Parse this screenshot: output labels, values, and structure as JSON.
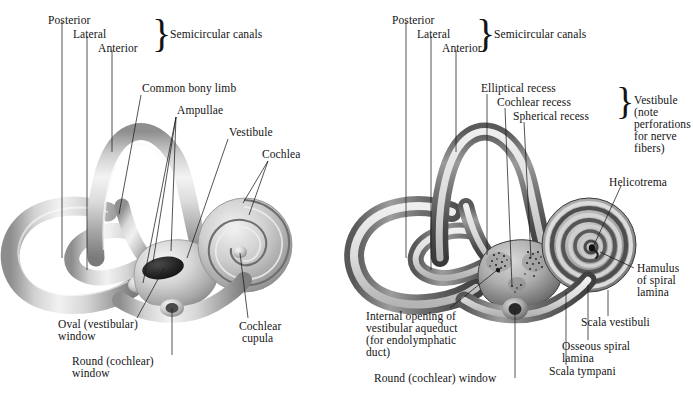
{
  "figure": {
    "background_color": "#ffffff",
    "ink_color": "#141414",
    "panels": [
      {
        "id": "left",
        "name": "bony-labyrinth-external-view",
        "caption": "External (surface) view of the right bony labyrinth"
      },
      {
        "id": "right",
        "name": "bony-labyrinth-sectioned-view",
        "caption": "Sectioned (cut-away) view of the right bony labyrinth"
      }
    ]
  },
  "left_panel": {
    "brace_glyph": "}",
    "labels": {
      "posterior": "Posterior",
      "lateral": "Lateral",
      "anterior": "Anterior",
      "semicircular_canals": "Semicircular canals",
      "common_bony_limb": "Common bony limb",
      "ampullae": "Ampullae",
      "vestibule": "Vestibule",
      "cochlea": "Cochlea",
      "oval_window_line1": "Oval (vestibular)",
      "oval_window_line2": "window",
      "round_window_line1": "Round (cochlear)",
      "round_window_line2": "window",
      "cochlear_cupula_line1": "Cochlear",
      "cochlear_cupula_line2": "cupula"
    }
  },
  "right_panel": {
    "brace_glyph": "}",
    "labels": {
      "posterior": "Posterior",
      "lateral": "Lateral",
      "anterior": "Anterior",
      "semicircular_canals": "Semicircular canals",
      "elliptical_recess": "Elliptical recess",
      "cochlear_recess": "Cochlear recess",
      "spherical_recess": "Spherical recess",
      "vestibule_line1": "Vestibule",
      "vestibule_line2": "(note",
      "vestibule_line3": "perforations",
      "vestibule_line4": "for nerve",
      "vestibule_line5": "fibers)",
      "helicotrema": "Helicotrema",
      "hamulus_line1": "Hamulus",
      "hamulus_line2": "of spiral",
      "hamulus_line3": "lamina",
      "scala_vestibuli": "Scala vestibuli",
      "osseous_spiral_lamina_line1": "Osseous spiral",
      "osseous_spiral_lamina_line2": "lamina",
      "scala_tympani": "Scala tympani",
      "internal_opening_line1": "Internal opening of",
      "internal_opening_line2": "vestibular aqueduct",
      "internal_opening_line3": "(for endolymphatic",
      "internal_opening_line4": "duct)",
      "round_window": "Round (cochlear) window"
    }
  }
}
